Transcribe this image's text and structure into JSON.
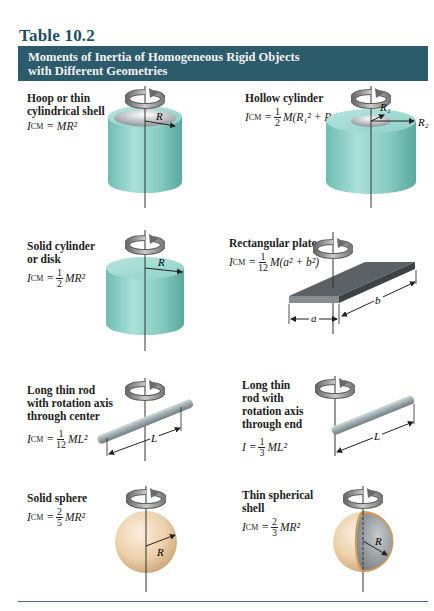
{
  "table": {
    "number": "Table 10.2",
    "title_line1": "Moments of Inertia of Homogeneous Rigid Objects",
    "title_line2": "with Different Geometries",
    "header_color": "#2c5b6c",
    "rule_color": "#3e6b7a"
  },
  "objects": [
    {
      "name": "hoop",
      "label_lines": [
        "Hoop or thin",
        "cylindrical shell"
      ],
      "formula_lhs": "I",
      "formula_lhs_sub": "CM",
      "formula_rhs": "= MR²",
      "labels": [
        "R"
      ]
    },
    {
      "name": "hollow-cylinder",
      "label_lines": [
        "Hollow cylinder"
      ],
      "formula_lhs": "I",
      "formula_lhs_sub": "CM",
      "frac_num": "1",
      "frac_den": "2",
      "formula_rhs": "M(R₁² + R₂²)",
      "labels": [
        "R₁",
        "R₂"
      ]
    },
    {
      "name": "solid-cylinder",
      "label_lines": [
        "Solid cylinder",
        "or disk"
      ],
      "formula_lhs": "I",
      "formula_lhs_sub": "CM",
      "frac_num": "1",
      "frac_den": "2",
      "formula_rhs": "MR²",
      "labels": [
        "R"
      ]
    },
    {
      "name": "rectangular-plate",
      "label_lines": [
        "Rectangular plate"
      ],
      "formula_lhs": "I",
      "formula_lhs_sub": "CM",
      "frac_num": "1",
      "frac_den": "12",
      "formula_rhs": "M(a² + b²)",
      "labels": [
        "a",
        "b"
      ]
    },
    {
      "name": "rod-center",
      "label_lines": [
        "Long thin rod",
        "with rotation axis",
        "through center"
      ],
      "formula_lhs": "I",
      "formula_lhs_sub": "CM",
      "frac_num": "1",
      "frac_den": "12",
      "formula_rhs": "ML²",
      "labels": [
        "L"
      ]
    },
    {
      "name": "rod-end",
      "label_lines": [
        "Long thin",
        "rod with",
        "rotation axis",
        "through end"
      ],
      "formula_lhs": "I",
      "formula_lhs_sub": "",
      "frac_num": "1",
      "frac_den": "3",
      "formula_rhs": "ML²",
      "labels": [
        "L"
      ]
    },
    {
      "name": "solid-sphere",
      "label_lines": [
        "Solid sphere"
      ],
      "formula_lhs": "I",
      "formula_lhs_sub": "CM",
      "frac_num": "2",
      "frac_den": "5",
      "formula_rhs": "MR²",
      "labels": [
        "R"
      ]
    },
    {
      "name": "thin-spherical-shell",
      "label_lines": [
        "Thin spherical",
        "shell"
      ],
      "formula_lhs": "I",
      "formula_lhs_sub": "CM",
      "frac_num": "2",
      "frac_den": "3",
      "formula_rhs": "MR²",
      "labels": [
        "R"
      ]
    }
  ],
  "colors": {
    "cylinder": "#8fd0c6",
    "cylinder_dark": "#5fae a4",
    "plate": "#555b5e",
    "rod": "#9aa8ac",
    "sphere": "#e9c9a0",
    "shell_inner": "#8e9296"
  }
}
